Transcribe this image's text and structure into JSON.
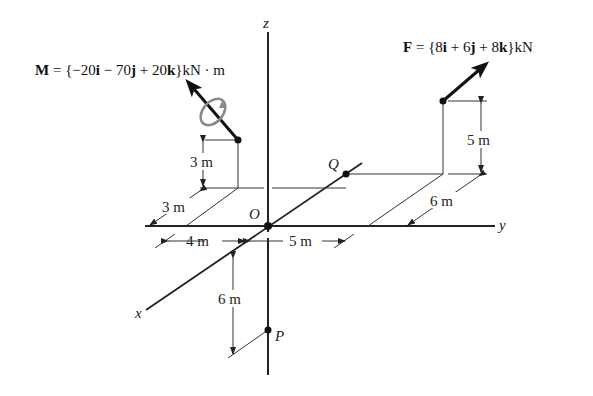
{
  "diagram": {
    "axes": {
      "x": "x",
      "y": "y",
      "z": "z"
    },
    "points": {
      "origin": "O",
      "q": "Q",
      "p": "P"
    },
    "moment": {
      "symbol": "M",
      "eq": " = {−20",
      "i": "i",
      "mid1": " − 70",
      "j": "j",
      "mid2": " + 20",
      "k": "k",
      "unit": "}kN · m"
    },
    "force": {
      "symbol": "F",
      "eq": " = {8",
      "i": "i",
      "mid1": " + 6",
      "j": "j",
      "mid2": " + 8",
      "k": "k",
      "unit": "}kN"
    },
    "dimensions": {
      "m_height": "3 m",
      "m_depth": "3 m",
      "left_y": "4 m",
      "right_y": "5 m",
      "f_height": "5 m",
      "f_depth": "6 m",
      "p_depth": "6 m"
    }
  }
}
